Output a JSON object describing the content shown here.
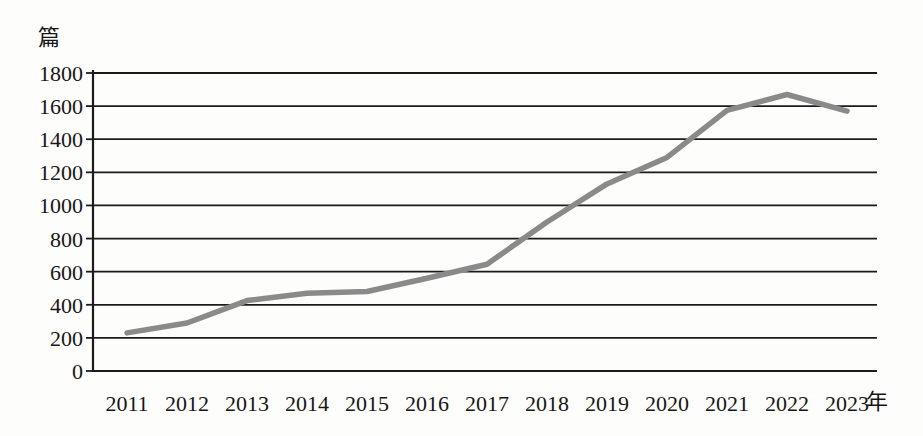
{
  "chart_data": {
    "type": "line",
    "title": "",
    "ylabel": "篇",
    "xlabel": "年",
    "categories": [
      "2011",
      "2012",
      "2013",
      "2014",
      "2015",
      "2016",
      "2017",
      "2018",
      "2019",
      "2020",
      "2021",
      "2022",
      "2023"
    ],
    "series": [
      {
        "name": "发文量",
        "values": [
          230,
          290,
          425,
          470,
          480,
          560,
          645,
          900,
          1130,
          1290,
          1575,
          1670,
          1570
        ]
      }
    ],
    "ylim": [
      0,
      1800
    ],
    "ytick_step": 200,
    "yticks": [
      0,
      200,
      400,
      600,
      800,
      1000,
      1200,
      1400,
      1600,
      1800
    ],
    "grid": "horizontal",
    "legend": "none",
    "line_color": "#8a8a8a",
    "axis_color": "#1b1b1b",
    "text_color": "#161616",
    "background_color": "#fdfdfb"
  }
}
